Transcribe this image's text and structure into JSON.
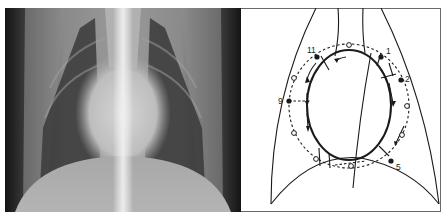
{
  "figure": {
    "left_panel": {
      "type": "radiograph",
      "description": "Dorsoventral thoracic radiograph showing cardiac silhouette"
    },
    "right_panel": {
      "type": "schematic",
      "description": "Clock-face schematic of cardiac silhouette with landmark positions",
      "clock_labels": [
        {
          "id": "11",
          "text": "11"
        },
        {
          "id": "1",
          "text": "1"
        },
        {
          "id": "2",
          "text": "2"
        },
        {
          "id": "9",
          "text": "9"
        },
        {
          "id": "5",
          "text": "5"
        }
      ]
    }
  },
  "colors": {
    "ink": "#1a1a1a",
    "frame": "#6a6a6a",
    "xray_dark": "#161616",
    "xray_light": "#d8d8d8"
  }
}
